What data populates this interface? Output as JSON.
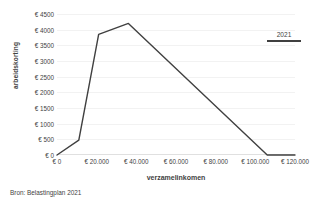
{
  "chart_data": {
    "type": "line",
    "title": "",
    "xlabel": "verzamelinkomen",
    "ylabel": "arbeidskorting",
    "xlim": [
      0,
      120000
    ],
    "ylim": [
      0,
      4500
    ],
    "grid": true,
    "legend_position": "top-right",
    "x_tick_labels": [
      "€ 0",
      "€ 20.000",
      "€ 40.000",
      "€ 60.000",
      "€ 80.000",
      "€ 100.000",
      "€ 120.000"
    ],
    "x_tick_values": [
      0,
      20000,
      40000,
      60000,
      80000,
      100000,
      120000
    ],
    "y_tick_labels": [
      "€ 0",
      "€ 500",
      "€ 1000",
      "€ 1500",
      "€ 2000",
      "€ 2500",
      "€ 3000",
      "€ 3500",
      "€ 4000",
      "€ 4500"
    ],
    "y_tick_values": [
      0,
      500,
      1000,
      1500,
      2000,
      2500,
      3000,
      3500,
      4000,
      4500
    ],
    "series": [
      {
        "name": "2021",
        "color": "#404040",
        "x": [
          0,
          11000,
          21000,
          36000,
          106000,
          120000
        ],
        "values": [
          0,
          475,
          3850,
          4200,
          0,
          0
        ]
      }
    ]
  },
  "legend": {
    "entries": [
      {
        "label": "2021",
        "color": "#404040"
      }
    ]
  },
  "source": {
    "text": "Bron: Belastingplan 2021"
  }
}
